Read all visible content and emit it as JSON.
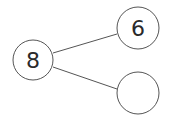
{
  "diagram": {
    "type": "number-bond",
    "whole": {
      "value": "8"
    },
    "parts": [
      {
        "value": "6"
      },
      {
        "value": ""
      }
    ],
    "colors": {
      "stroke": "#555555",
      "text": "#2a2a2a",
      "background": "#ffffff"
    }
  }
}
